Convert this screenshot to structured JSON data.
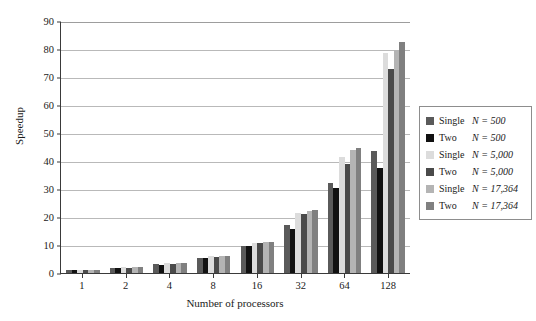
{
  "chart_data": {
    "type": "bar",
    "title": "",
    "xlabel": "Number of processors",
    "ylabel": "Speedup",
    "categories": [
      "1",
      "2",
      "4",
      "8",
      "16",
      "32",
      "64",
      "128"
    ],
    "ylim": [
      0,
      90
    ],
    "yticks": [
      0,
      10,
      20,
      30,
      40,
      50,
      60,
      70,
      80,
      90
    ],
    "grid": true,
    "legend_position": "right",
    "series": [
      {
        "name": "Single N = 500",
        "kind": "Single",
        "n": "N = 500",
        "color": "#5a5a5a",
        "values": [
          1,
          1.9,
          3.2,
          5.4,
          9.8,
          17.3,
          32.0,
          43.5
        ]
      },
      {
        "name": "Two N = 500",
        "kind": "Two",
        "n": "N = 500",
        "color": "#111111",
        "values": [
          1,
          1.8,
          3.0,
          5.2,
          9.6,
          15.6,
          30.3,
          37.5
        ]
      },
      {
        "name": "Single N = 5,000",
        "kind": "Single",
        "n": "N = 5,000",
        "color": "#dcdcdc",
        "values": [
          1,
          2.0,
          3.4,
          6.0,
          10.8,
          21.3,
          41.5,
          78.5
        ]
      },
      {
        "name": "Two N = 5,000",
        "kind": "Two",
        "n": "N = 5,000",
        "color": "#4a4a4a",
        "values": [
          1,
          1.9,
          3.3,
          5.8,
          10.6,
          20.9,
          38.8,
          73.0
        ]
      },
      {
        "name": "Single N = 17,364",
        "kind": "Single",
        "n": "N = 17,364",
        "color": "#b4b4b4",
        "values": [
          1,
          2.0,
          3.5,
          6.1,
          11.1,
          22.2,
          43.8,
          79.5
        ]
      },
      {
        "name": "Two N = 17,364",
        "kind": "Two",
        "n": "N = 17,364",
        "color": "#808080",
        "values": [
          1,
          2.0,
          3.4,
          6.0,
          11.0,
          22.6,
          44.8,
          82.5
        ]
      }
    ]
  }
}
